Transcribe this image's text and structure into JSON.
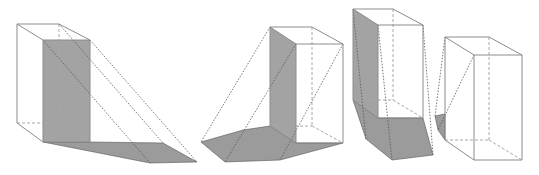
{
  "figure": {
    "colors": {
      "background": "#ffffff",
      "shadow_fill": "#9b9b9b",
      "shaded_face": "#a3a3a3",
      "visible_edge": "#8c8c8c",
      "hidden_edge": "#a8a8a8",
      "light_ray": "#555555"
    },
    "boxes": [
      {
        "id": "box-1",
        "top": [
          [
            17,
            24
          ],
          [
            59,
            24
          ],
          [
            90,
            40
          ],
          [
            43,
            40
          ]
        ],
        "bottom": [
          [
            17,
            123
          ],
          [
            59,
            123
          ],
          [
            90,
            142
          ],
          [
            43,
            142
          ]
        ],
        "shaded_face": [
          [
            43,
            40
          ],
          [
            90,
            40
          ],
          [
            90,
            142
          ],
          [
            43,
            142
          ]
        ],
        "shadow": [
          [
            43,
            142
          ],
          [
            90,
            142
          ],
          [
            163,
            143
          ],
          [
            197,
            162
          ],
          [
            150,
            163
          ]
        ],
        "rays": [
          [
            [
              59,
              24
            ],
            [
              163,
              143
            ]
          ],
          [
            [
              90,
              40
            ],
            [
              197,
              162
            ]
          ],
          [
            [
              43,
              40
            ],
            [
              150,
              163
            ]
          ]
        ]
      },
      {
        "id": "box-2",
        "top": [
          [
            270,
            27
          ],
          [
            312,
            27
          ],
          [
            343,
            44
          ],
          [
            296,
            44
          ]
        ],
        "bottom": [
          [
            270,
            126
          ],
          [
            312,
            126
          ],
          [
            343,
            143
          ],
          [
            296,
            143
          ]
        ],
        "shaded_face": [
          [
            270,
            27
          ],
          [
            296,
            44
          ],
          [
            296,
            143
          ],
          [
            270,
            126
          ]
        ],
        "shadow": [
          [
            201,
            142
          ],
          [
            243,
            130
          ],
          [
            270,
            126
          ],
          [
            296,
            143
          ],
          [
            343,
            143
          ],
          [
            280,
            160
          ],
          [
            225,
            162
          ]
        ],
        "rays": [
          [
            [
              270,
              27
            ],
            [
              201,
              142
            ]
          ],
          [
            [
              296,
              44
            ],
            [
              225,
              162
            ]
          ],
          [
            [
              343,
              44
            ],
            [
              280,
              160
            ]
          ]
        ]
      },
      {
        "id": "box-3",
        "top": [
          [
            353,
            9
          ],
          [
            393,
            9
          ],
          [
            423,
            25
          ],
          [
            378,
            25
          ]
        ],
        "bottom": [
          [
            353,
            100
          ],
          [
            393,
            100
          ],
          [
            423,
            118
          ],
          [
            378,
            118
          ]
        ],
        "shaded_face": [
          [
            353,
            9
          ],
          [
            378,
            25
          ],
          [
            378,
            118
          ],
          [
            353,
            100
          ]
        ],
        "shadow": [
          [
            353,
            100
          ],
          [
            378,
            118
          ],
          [
            423,
            118
          ],
          [
            433,
            155
          ],
          [
            392,
            160
          ],
          [
            366,
            139
          ]
        ],
        "rays": [
          [
            [
              353,
              9
            ],
            [
              366,
              139
            ]
          ],
          [
            [
              378,
              25
            ],
            [
              392,
              160
            ]
          ],
          [
            [
              423,
              25
            ],
            [
              433,
              155
            ]
          ]
        ]
      },
      {
        "id": "box-4",
        "top": [
          [
            445,
            37
          ],
          [
            489,
            37
          ],
          [
            522,
            55
          ],
          [
            474,
            55
          ]
        ],
        "bottom": [
          [
            445,
            140
          ],
          [
            489,
            140
          ],
          [
            522,
            160
          ],
          [
            474,
            160
          ]
        ],
        "shaded_face": null,
        "shadow": [
          [
            435,
            116
          ],
          [
            445,
            114
          ],
          [
            445,
            140
          ],
          [
            438,
            130
          ]
        ],
        "rays": [
          [
            [
              445,
              37
            ],
            [
              435,
              116
            ]
          ],
          [
            [
              474,
              55
            ],
            [
              438,
              130
            ]
          ]
        ]
      }
    ]
  }
}
